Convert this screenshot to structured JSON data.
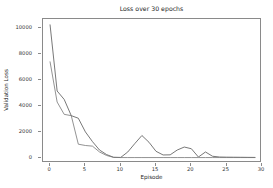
{
  "chart_data": {
    "type": "line",
    "title": "Loss over 30 epochs",
    "xlabel": "Episode",
    "ylabel": "Validation Loss",
    "xlim": [
      -1,
      30
    ],
    "ylim": [
      -400,
      10700
    ],
    "grid": false,
    "legend": "none",
    "xticks": [
      0,
      5,
      10,
      15,
      20,
      25,
      30
    ],
    "yticks": [
      0,
      2000,
      4000,
      6000,
      8000,
      10000
    ],
    "xtick_labels": [
      "0",
      "5",
      "10",
      "15",
      "20",
      "25",
      "30"
    ],
    "ytick_labels": [
      "0",
      "2000",
      "4000",
      "6000",
      "8000",
      "10000"
    ],
    "x": [
      0,
      1,
      2,
      3,
      4,
      5,
      6,
      7,
      8,
      9,
      10,
      11,
      12,
      13,
      14,
      15,
      16,
      17,
      18,
      19,
      20,
      21,
      22,
      23,
      24,
      25,
      26,
      27,
      28,
      29
    ],
    "series": [
      {
        "name": "train-loss",
        "color": "#555555",
        "values": [
          10250,
          5150,
          4500,
          3250,
          3050,
          2000,
          1250,
          600,
          250,
          40,
          30,
          450,
          1100,
          1720,
          1200,
          500,
          220,
          230,
          600,
          830,
          700,
          60,
          450,
          120,
          60,
          50,
          45,
          40,
          35,
          30
        ]
      },
      {
        "name": "validation-loss",
        "color": "#777777",
        "values": [
          7400,
          4300,
          3350,
          3250,
          1050,
          950,
          900,
          450,
          180,
          30,
          20,
          20,
          20,
          20,
          20,
          20,
          20,
          20,
          20,
          20,
          20,
          20,
          20,
          20,
          20,
          20,
          20,
          20,
          20,
          20
        ]
      }
    ]
  }
}
